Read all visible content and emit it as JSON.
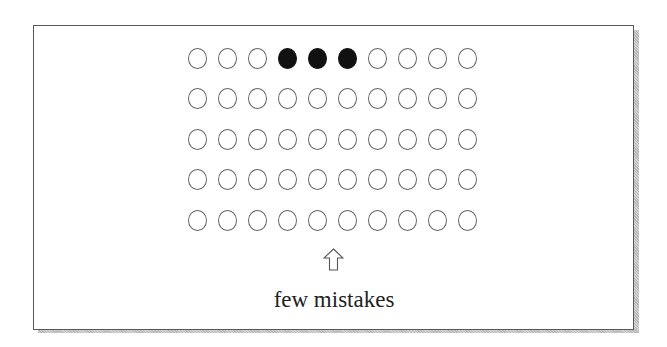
{
  "diagram": {
    "caption": "few mistakes",
    "grid": {
      "rows": 5,
      "cols": 10,
      "filled": [
        [
          0,
          3
        ],
        [
          0,
          4
        ],
        [
          0,
          5
        ]
      ]
    },
    "arrow_icon": "up-arrow-outline",
    "colors": {
      "filled": "#111111",
      "outline": "#666666",
      "frame_border": "#5a5a5a",
      "text": "#222222"
    }
  }
}
